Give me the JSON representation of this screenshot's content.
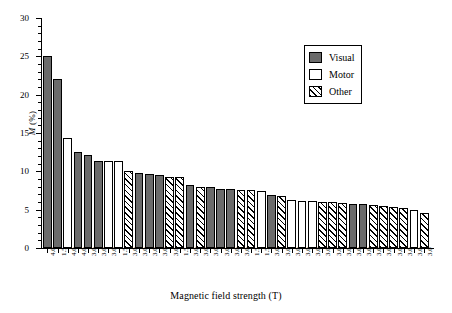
{
  "chart_data": {
    "type": "bar",
    "title": "",
    "xlabel": "Magnetic field strength (T)",
    "ylabel": "M (%)",
    "ylim": [
      0,
      30
    ],
    "ytick_labels": [
      "0",
      "5",
      "10",
      "15",
      "20",
      "25",
      "30"
    ],
    "ytick_values": [
      0,
      5,
      10,
      15,
      20,
      25,
      30
    ],
    "yminor_step": 1,
    "grid": false,
    "legend_position": "top-right",
    "legend": [
      {
        "label": "Visual",
        "key": "visual",
        "color": "#6b6b6b",
        "pattern": "solid-gray"
      },
      {
        "label": "Motor",
        "key": "motor",
        "color": "#ffffff",
        "pattern": "empty"
      },
      {
        "label": "Other",
        "key": "other",
        "color": "#ffffff",
        "pattern": "diagonal-hatch"
      }
    ],
    "categories": [
      "4.0",
      "1.5",
      "4.0",
      "4.0",
      "3.0",
      "3.0",
      "3.0",
      "1.5",
      "3.0",
      "3.0",
      "3.0",
      "3.0",
      "3.0",
      "1.5",
      "3.0",
      "3.0",
      "3.0",
      "3.0",
      "3.0",
      "3.0",
      "1.5",
      "1.5",
      "3.0",
      "3.0",
      "3.0",
      "3.0",
      "3.0",
      "3.0",
      "3.0",
      "3.0",
      "3.0",
      "3.0",
      "3.0",
      "3.0",
      "3.0",
      "3.0",
      "3.0",
      "3.0"
    ],
    "values": [
      25.0,
      22.1,
      14.3,
      12.5,
      12.1,
      11.3,
      11.3,
      11.3,
      10.0,
      9.8,
      9.7,
      9.5,
      9.3,
      9.3,
      8.2,
      8.0,
      7.9,
      7.7,
      7.7,
      7.6,
      7.6,
      7.5,
      6.9,
      6.8,
      6.2,
      6.1,
      6.1,
      6.0,
      6.0,
      5.9,
      5.8,
      5.7,
      5.6,
      5.5,
      5.4,
      5.2,
      5.0,
      4.6
    ],
    "groups": [
      "visual",
      "visual",
      "motor",
      "visual",
      "visual",
      "visual",
      "motor",
      "motor",
      "other",
      "visual",
      "visual",
      "visual",
      "other",
      "other",
      "visual",
      "other",
      "visual",
      "visual",
      "visual",
      "other",
      "other",
      "motor",
      "visual",
      "other",
      "motor",
      "motor",
      "motor",
      "other",
      "other",
      "other",
      "visual",
      "visual",
      "other",
      "other",
      "other",
      "other",
      "motor",
      "other"
    ]
  }
}
